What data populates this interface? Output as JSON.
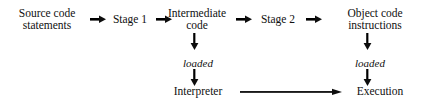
{
  "diagram": {
    "background_color": "#ffffff",
    "ink_color": "#0d0d0d",
    "nodes": {
      "source": {
        "line1": "Source code",
        "line2": "statements"
      },
      "stage1": {
        "line1": "Stage 1"
      },
      "intermediate": {
        "line1": "Intermediate",
        "line2": "code"
      },
      "stage2": {
        "line1": "Stage 2"
      },
      "object": {
        "line1": "Object code",
        "line2": "instructions"
      },
      "interpreter": {
        "line1": "Interpreter"
      },
      "execution": {
        "line1": "Execution"
      }
    },
    "edge_labels": {
      "loaded_left": "loaded",
      "loaded_right": "loaded"
    }
  }
}
